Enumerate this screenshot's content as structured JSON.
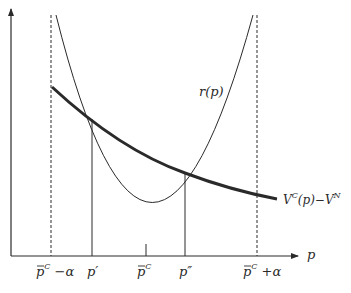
{
  "diagram": {
    "axes": {
      "x_label": "p",
      "y_label": ""
    },
    "curves": {
      "parabola_label": "r(p)",
      "thick_curve_label_main": "V",
      "thick_curve_label_sup1": "C",
      "thick_curve_label_mid": "(p)−V",
      "thick_curve_label_sup2": "N"
    },
    "x_ticks": [
      {
        "id": "left-bound",
        "base": "p",
        "sup": "C",
        "suffix": " −α",
        "overline": true
      },
      {
        "id": "p-prime",
        "base": "p",
        "sup": "",
        "suffix": "′",
        "overline": false
      },
      {
        "id": "p-bar-c",
        "base": "p",
        "sup": "C",
        "suffix": "",
        "overline": true
      },
      {
        "id": "p-double-prime",
        "base": "p",
        "sup": "",
        "suffix": "″",
        "overline": false
      },
      {
        "id": "right-bound",
        "base": "p",
        "sup": "C",
        "suffix": " +α",
        "overline": true
      }
    ],
    "colors": {
      "ink": "#2a2a2a",
      "background": "#ffffff"
    }
  }
}
